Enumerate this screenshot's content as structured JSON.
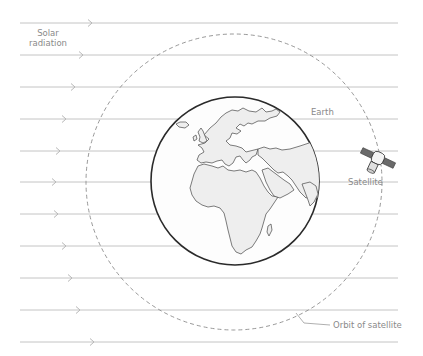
{
  "diagram": {
    "labels": {
      "solar_radiation_line1": "Solar",
      "solar_radiation_line2": "radiation",
      "earth": "Earth",
      "satellite": "Satellite",
      "orbit": "Orbit of satellite"
    },
    "rays": {
      "count": 11,
      "direction": "left-to-right",
      "x_start": 20,
      "x_end": 398,
      "y_positions": [
        23,
        55,
        87,
        119,
        151,
        182,
        214,
        246,
        278,
        310,
        342
      ],
      "arrowhead_x": [
        92,
        83,
        75,
        66,
        60,
        56,
        58,
        66,
        72,
        80,
        94
      ],
      "color": "#c4c4c4"
    },
    "earth": {
      "center": [
        235,
        181
      ],
      "radius": 84,
      "outline_color": "#2a2a2a",
      "land_color": "#eeeeee",
      "continents_visible": [
        "Europe",
        "Africa",
        "Arabian Peninsula",
        "India"
      ]
    },
    "orbit": {
      "center": [
        234,
        182
      ],
      "radius": 148,
      "style": "dashed",
      "color": "#8c8c8c"
    },
    "satellite": {
      "position": [
        378,
        158
      ],
      "icon": "satellite-icon"
    }
  }
}
